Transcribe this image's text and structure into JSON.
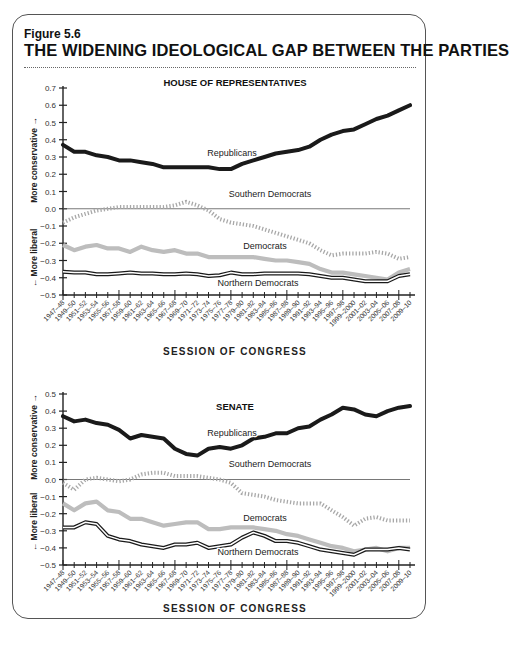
{
  "figure": {
    "label": "Figure 5.6",
    "title": "THE WIDENING IDEOLOGICAL GAP BETWEEN THE PARTIES"
  },
  "colors": {
    "republicans": "#1a1a1a",
    "southern_democrats": "#a8a8a8",
    "democrats": "#bdbdbd",
    "northern_democrats": "#1a1a1a",
    "zero_line": "#555555",
    "axis": "#222222"
  },
  "chart_data": [
    {
      "type": "line",
      "title": "HOUSE OF REPRESENTATIVES",
      "xlabel": "SESSION OF CONGRESS",
      "ylabel_up": "More conservative →",
      "ylabel_down": "← More liberal",
      "ylim": [
        -0.5,
        0.7
      ],
      "yticks": [
        "0.7",
        "0.6",
        "0.5",
        "0.4",
        "0.3",
        "0.2",
        "0.1",
        "0.0",
        "−0.1",
        "−0.2",
        "−0.3",
        "−0.4",
        "−0.5"
      ],
      "grid": false,
      "zero_line": true,
      "categories": [
        "1947–48",
        "1949–50",
        "1951–52",
        "1953–54",
        "1955–56",
        "1957–58",
        "1959–60",
        "1961–62",
        "1963–64",
        "1965–66",
        "1967–68",
        "1969–70",
        "1971–72",
        "1973–74",
        "1975–76",
        "1977–78",
        "1979–80",
        "1981–82",
        "1983–84",
        "1985–86",
        "1987–88",
        "1989–90",
        "1991–92",
        "1993–94",
        "1995–96",
        "1997–98",
        "1999–2000",
        "2001–02",
        "2003–04",
        "2005–06",
        "2007–08",
        "2009–10"
      ],
      "series": [
        {
          "name": "Republicans",
          "style": "thick-black",
          "values": [
            0.37,
            0.33,
            0.33,
            0.31,
            0.3,
            0.28,
            0.28,
            0.27,
            0.26,
            0.24,
            0.24,
            0.24,
            0.24,
            0.24,
            0.23,
            0.23,
            0.26,
            0.28,
            0.3,
            0.32,
            0.33,
            0.34,
            0.36,
            0.4,
            0.43,
            0.45,
            0.46,
            0.49,
            0.52,
            0.54,
            0.57,
            0.6
          ]
        },
        {
          "name": "Southern Democrats",
          "style": "dotted-gray",
          "values": [
            -0.08,
            -0.05,
            -0.03,
            -0.01,
            0.0,
            0.01,
            0.01,
            0.01,
            0.01,
            0.01,
            0.02,
            0.04,
            0.02,
            -0.01,
            -0.06,
            -0.08,
            -0.09,
            -0.1,
            -0.12,
            -0.14,
            -0.16,
            -0.18,
            -0.2,
            -0.24,
            -0.27,
            -0.26,
            -0.26,
            -0.26,
            -0.25,
            -0.26,
            -0.29,
            -0.28
          ]
        },
        {
          "name": "Democrats",
          "style": "thick-gray",
          "values": [
            -0.21,
            -0.24,
            -0.22,
            -0.21,
            -0.23,
            -0.23,
            -0.25,
            -0.22,
            -0.24,
            -0.25,
            -0.24,
            -0.26,
            -0.26,
            -0.28,
            -0.28,
            -0.28,
            -0.28,
            -0.28,
            -0.29,
            -0.3,
            -0.3,
            -0.31,
            -0.32,
            -0.35,
            -0.37,
            -0.37,
            -0.38,
            -0.39,
            -0.4,
            -0.41,
            -0.37,
            -0.35
          ]
        },
        {
          "name": "Northern Democrats",
          "style": "double-line",
          "values": [
            -0.365,
            -0.37,
            -0.37,
            -0.38,
            -0.38,
            -0.375,
            -0.37,
            -0.375,
            -0.375,
            -0.38,
            -0.38,
            -0.375,
            -0.38,
            -0.39,
            -0.385,
            -0.37,
            -0.38,
            -0.38,
            -0.375,
            -0.375,
            -0.375,
            -0.375,
            -0.38,
            -0.39,
            -0.4,
            -0.4,
            -0.41,
            -0.42,
            -0.42,
            -0.42,
            -0.39,
            -0.38
          ]
        }
      ],
      "labels": [
        {
          "text": "Republicans",
          "series": "Republicans"
        },
        {
          "text": "Southern Democrats",
          "series": "Southern Democrats"
        },
        {
          "text": "Democrats",
          "series": "Democrats"
        },
        {
          "text": "Northern Democrats",
          "series": "Northern Democrats"
        }
      ]
    },
    {
      "type": "line",
      "title": "SENATE",
      "xlabel": "SESSION OF CONGRESS",
      "ylabel_up": "More conservative →",
      "ylabel_down": "← More liberal",
      "ylim": [
        -0.5,
        0.5
      ],
      "yticks": [
        "0.5",
        "0.4",
        "0.3",
        "0.2",
        "0.1",
        "0.0",
        "−0.1",
        "−0.2",
        "−0.3",
        "−0.4",
        "−0.5"
      ],
      "grid": false,
      "zero_line": true,
      "categories": [
        "1947–48",
        "1949–50",
        "1951–52",
        "1953–54",
        "1955–56",
        "1957–58",
        "1959–60",
        "1961–62",
        "1963–64",
        "1965–66",
        "1967–68",
        "1969–70",
        "1971–72",
        "1973–74",
        "1975–76",
        "1977–78",
        "1979–80",
        "1981–82",
        "1983–84",
        "1985–86",
        "1987–88",
        "1989–90",
        "1991–92",
        "1993–94",
        "1995–96",
        "1997–98",
        "1999–2000",
        "2001–02",
        "2003–04",
        "2005–06",
        "2007–08",
        "2009–10"
      ],
      "series": [
        {
          "name": "Republicans",
          "style": "thick-black",
          "values": [
            0.37,
            0.34,
            0.35,
            0.33,
            0.32,
            0.29,
            0.24,
            0.26,
            0.25,
            0.24,
            0.18,
            0.15,
            0.14,
            0.18,
            0.19,
            0.18,
            0.2,
            0.24,
            0.25,
            0.27,
            0.27,
            0.3,
            0.31,
            0.35,
            0.38,
            0.42,
            0.41,
            0.38,
            0.37,
            0.4,
            0.42,
            0.43
          ]
        },
        {
          "name": "Southern Democrats",
          "style": "dotted-gray",
          "values": [
            -0.02,
            -0.06,
            0.0,
            0.01,
            0.0,
            -0.01,
            0.0,
            0.03,
            0.04,
            0.04,
            0.02,
            0.02,
            0.02,
            0.01,
            0.0,
            -0.02,
            -0.08,
            -0.09,
            -0.1,
            -0.12,
            -0.13,
            -0.14,
            -0.14,
            -0.14,
            -0.18,
            -0.22,
            -0.27,
            -0.23,
            -0.22,
            -0.24,
            -0.24,
            -0.24
          ]
        },
        {
          "name": "Democrats",
          "style": "thick-gray",
          "values": [
            -0.14,
            -0.18,
            -0.14,
            -0.13,
            -0.18,
            -0.19,
            -0.23,
            -0.23,
            -0.25,
            -0.27,
            -0.26,
            -0.25,
            -0.25,
            -0.29,
            -0.29,
            -0.28,
            -0.28,
            -0.28,
            -0.29,
            -0.3,
            -0.32,
            -0.33,
            -0.35,
            -0.37,
            -0.39,
            -0.4,
            -0.42,
            -0.41,
            -0.4,
            -0.42,
            -0.4,
            -0.4
          ]
        },
        {
          "name": "Northern Democrats",
          "style": "double-line",
          "values": [
            -0.28,
            -0.28,
            -0.25,
            -0.26,
            -0.33,
            -0.35,
            -0.36,
            -0.38,
            -0.39,
            -0.4,
            -0.38,
            -0.38,
            -0.37,
            -0.4,
            -0.39,
            -0.38,
            -0.34,
            -0.31,
            -0.33,
            -0.36,
            -0.36,
            -0.37,
            -0.39,
            -0.41,
            -0.42,
            -0.43,
            -0.44,
            -0.41,
            -0.41,
            -0.41,
            -0.4,
            -0.41
          ]
        }
      ],
      "labels": [
        {
          "text": "Republicans",
          "series": "Republicans"
        },
        {
          "text": "Southern Democrats",
          "series": "Southern Democrats"
        },
        {
          "text": "Democrats",
          "series": "Democrats"
        },
        {
          "text": "Northern Democrats",
          "series": "Northern Democrats"
        }
      ]
    }
  ],
  "source_note": ""
}
